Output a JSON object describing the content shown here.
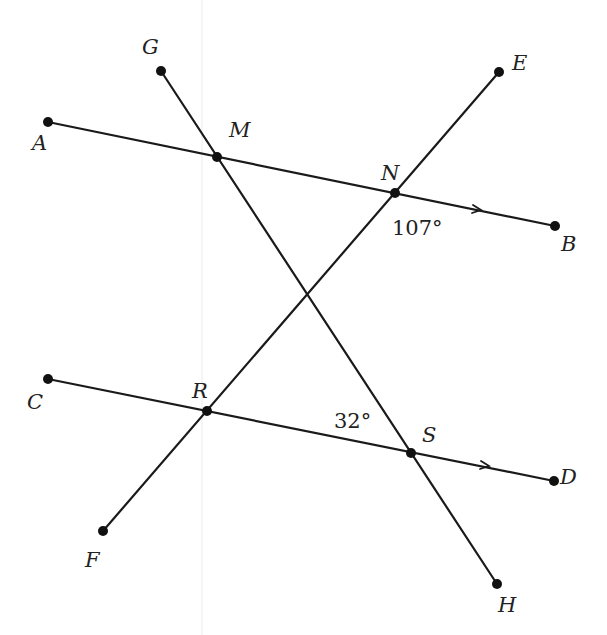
{
  "diagram": {
    "type": "geometry-parallel-lines-transversals",
    "colors": {
      "line": "#1a1a1a",
      "label": "#222222",
      "guide": "#e6e6e6"
    },
    "points": {
      "A": {
        "x": 48,
        "y": 122
      },
      "B": {
        "x": 555,
        "y": 226
      },
      "C": {
        "x": 48,
        "y": 379
      },
      "D": {
        "x": 554,
        "y": 481
      },
      "E": {
        "x": 499,
        "y": 72
      },
      "F": {
        "x": 103,
        "y": 531
      },
      "G": {
        "x": 161,
        "y": 71
      },
      "H": {
        "x": 497,
        "y": 584
      },
      "M": {
        "x": 217,
        "y": 157
      },
      "N": {
        "x": 395,
        "y": 193
      },
      "R": {
        "x": 207,
        "y": 411
      },
      "S": {
        "x": 411,
        "y": 453
      }
    },
    "segments": [
      {
        "from": "A",
        "to": "B",
        "parallel_mark": true
      },
      {
        "from": "C",
        "to": "D",
        "parallel_mark": true
      },
      {
        "from": "E",
        "to": "F"
      },
      {
        "from": "G",
        "to": "H"
      }
    ],
    "labels": {
      "A": "A",
      "B": "B",
      "C": "C",
      "D": "D",
      "E": "E",
      "F": "F",
      "G": "G",
      "H": "H",
      "M": "M",
      "N": "N",
      "R": "R",
      "S": "S"
    },
    "angles": [
      {
        "vertex": "N",
        "text": "107°"
      },
      {
        "vertex": "S",
        "text": "32°"
      }
    ]
  }
}
